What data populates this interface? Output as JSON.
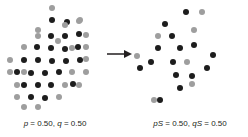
{
  "figure": {
    "arrow_icon": "right-arrow-icon",
    "dot_colors": {
      "dark": "#1d1d1d",
      "gray": "#9e9e9e"
    }
  },
  "panels": [
    {
      "id": "before",
      "caption": "p = 0.50, q = 0.50",
      "caption_parts": {
        "allele1_symbol": "p",
        "allele1_value": " = 0.50, ",
        "allele2_symbol": "q",
        "allele2_value": " = 0.50"
      },
      "dot_count": 48,
      "dark_count": 24,
      "gray_count": 24
    },
    {
      "id": "after",
      "caption": "pS = 0.50, qS = 0.50",
      "caption_parts": {
        "allele1_symbol": "pS",
        "allele1_value": " = 0.50, ",
        "allele2_symbol": "qS",
        "allele2_value": " = 0.50"
      },
      "dot_count": 22,
      "dark_count": 15,
      "gray_count": 7
    }
  ],
  "chart_data": {
    "type": "scatter",
    "title": "",
    "xlabel": "",
    "ylabel": "",
    "grid": false,
    "legend": "none",
    "series": [
      {
        "name": "before-dark",
        "panel": "before",
        "color": "#1d1d1d",
        "points": [
          [
            52,
            20
          ],
          [
            67,
            22
          ],
          [
            51,
            36
          ],
          [
            65,
            36
          ],
          [
            79,
            34
          ],
          [
            37,
            47
          ],
          [
            51,
            48
          ],
          [
            65,
            49
          ],
          [
            78,
            47
          ],
          [
            24,
            60
          ],
          [
            38,
            60
          ],
          [
            52,
            61
          ],
          [
            66,
            61
          ],
          [
            80,
            60
          ],
          [
            17,
            72
          ],
          [
            31,
            73
          ],
          [
            45,
            73
          ],
          [
            59,
            72
          ],
          [
            24,
            85
          ],
          [
            38,
            85
          ],
          [
            51,
            85
          ],
          [
            73,
            84
          ],
          [
            31,
            97
          ],
          [
            45,
            98
          ]
        ]
      },
      {
        "name": "before-gray",
        "panel": "before",
        "color": "#9e9e9e",
        "points": [
          [
            52,
            8
          ],
          [
            80,
            20
          ],
          [
            38,
            30
          ],
          [
            79,
            21
          ],
          [
            38,
            36
          ],
          [
            65,
            25
          ],
          [
            86,
            35
          ],
          [
            24,
            47
          ],
          [
            58,
            41
          ],
          [
            86,
            47
          ],
          [
            10,
            60
          ],
          [
            72,
            48
          ],
          [
            86,
            59
          ],
          [
            10,
            72
          ],
          [
            24,
            72
          ],
          [
            72,
            72
          ],
          [
            86,
            72
          ],
          [
            17,
            85
          ],
          [
            65,
            85
          ],
          [
            79,
            85
          ],
          [
            17,
            97
          ],
          [
            59,
            97
          ],
          [
            24,
            107
          ],
          [
            38,
            107
          ]
        ]
      },
      {
        "name": "after-dark",
        "panel": "after",
        "color": "#1d1d1d",
        "points": [
          [
            54,
            12
          ],
          [
            40,
            36
          ],
          [
            62,
            45
          ],
          [
            26,
            48
          ],
          [
            48,
            48
          ],
          [
            81,
            55
          ],
          [
            19,
            62
          ],
          [
            41,
            62
          ],
          [
            8,
            68
          ],
          [
            75,
            68
          ],
          [
            44,
            75
          ],
          [
            60,
            76
          ],
          [
            28,
            100
          ],
          [
            48,
            88
          ],
          [
            33,
            24
          ]
        ]
      },
      {
        "name": "after-gray",
        "panel": "after",
        "color": "#9e9e9e",
        "points": [
          [
            70,
            12
          ],
          [
            26,
            36
          ],
          [
            62,
            30
          ],
          [
            55,
            62
          ],
          [
            5,
            56
          ],
          [
            60,
            84
          ],
          [
            22,
            100
          ]
        ]
      }
    ]
  }
}
